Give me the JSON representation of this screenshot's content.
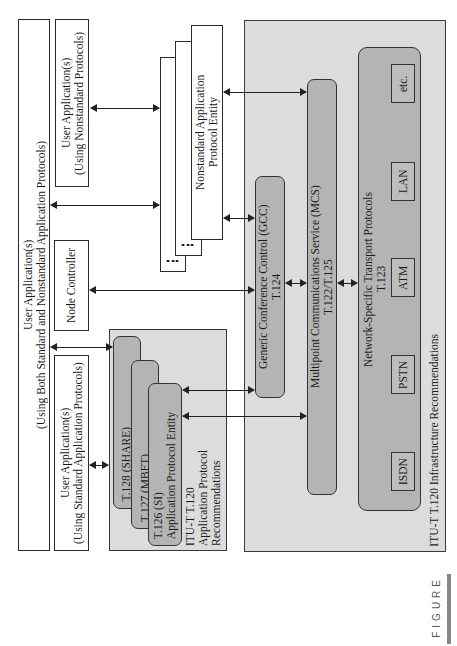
{
  "diagram": {
    "user_apps": {
      "both": {
        "line1": "User Application(s)",
        "line2": "(Using Both Standard and Nonstandard Application Protocols)"
      },
      "nonstandard": {
        "line1": "User Application(s)",
        "line2": "(Using Nonstandard Protocols)"
      },
      "standard": {
        "line1": "User Application(s)",
        "line2": "(Using Standard Application Protocols)"
      },
      "node_controller": "Node Controller"
    },
    "nonstandard_entity": {
      "line1": "Nonstandard Application",
      "line2": "Protocol Entity",
      "ellipsis": "..."
    },
    "app_protocol_recs": {
      "t128": "T.128 (SHARE)",
      "t127": "T.127 (MBFT)",
      "t126_line1": "T.126 (SI)",
      "t126_line2": "Application Protocol Entity",
      "label_line1": "ITU-T T.120",
      "label_line2": "Application Protocol",
      "label_line3": "Recommendations"
    },
    "infrastructure": {
      "gcc_line1": "Generic Conference Control (GCC)",
      "gcc_line2": "T.124",
      "mcs_line1": "Multipoint Communications Service (MCS)",
      "mcs_line2": "T.122/T.125",
      "transport_line1": "Network-Specific Transport Protocols",
      "transport_line2": "T.123",
      "networks": [
        "ISDN",
        "PSTN",
        "ATM",
        "LAN",
        "etc."
      ],
      "label": "ITU-T T.120 Infrastructure Recommendations"
    },
    "figure_label": "FIGURE"
  }
}
